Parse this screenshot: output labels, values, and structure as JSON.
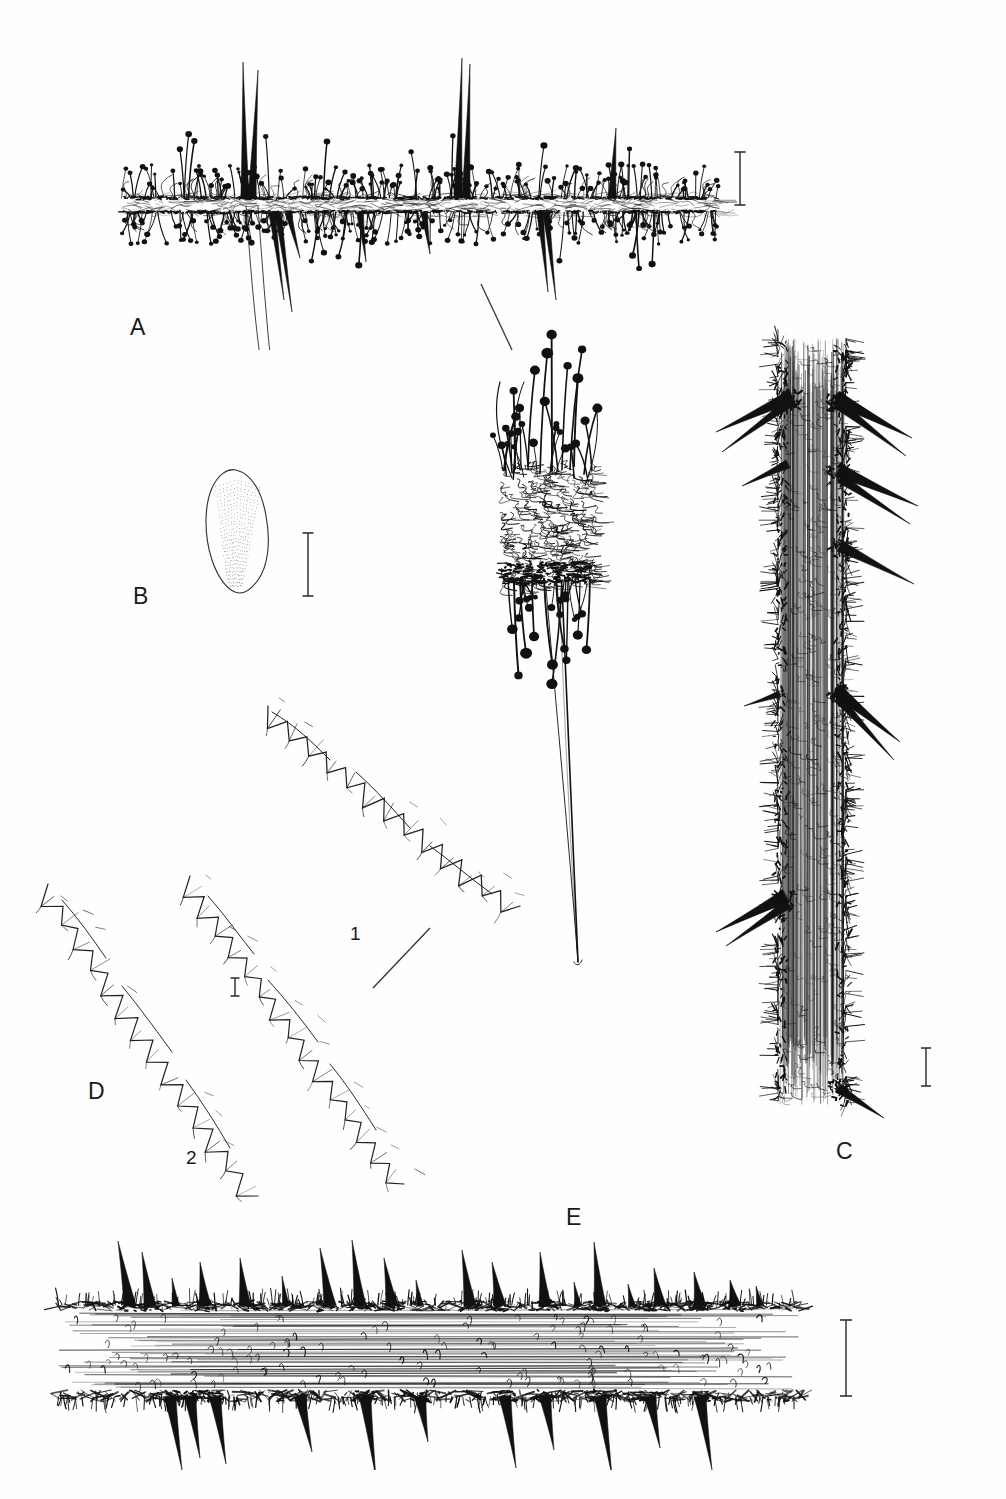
{
  "plate": {
    "title": "Botanical line-art plate of a spiny, glandular-hairy plant",
    "background_color": "#fefefe",
    "ink_color": "#111111",
    "width": 1006,
    "height": 1499,
    "medium": "pen-and-ink scientific illustration"
  },
  "panels": [
    {
      "id": "A",
      "label": "A",
      "label_x": 130,
      "label_y": 328,
      "subject": "stem or midrib in side view, densely covered with glandular capitate trichomes above and below, with several long slender prickles",
      "bounds": {
        "x": 118,
        "y": 60,
        "width": 610,
        "height": 280
      }
    },
    {
      "id": "B",
      "label": "B",
      "label_x": 133,
      "label_y": 597,
      "subject": "obovate petal or sepal with finely stippled longitudinal venation",
      "bounds": {
        "x": 196,
        "y": 468,
        "width": 80,
        "height": 125
      }
    },
    {
      "id": "C",
      "label": "C",
      "label_x": 836,
      "label_y": 1152,
      "subject": "vertical stem segment with dense indumentum and stout recurved lateral prickles",
      "bounds": {
        "x": 735,
        "y": 330,
        "width": 190,
        "height": 780
      }
    },
    {
      "id": "D",
      "label": "D",
      "label_x": 88,
      "label_y": 1092,
      "subject": "two leaf-margin details showing serrate to dentate teeth with bristle tips",
      "bounds": {
        "x": 45,
        "y": 700,
        "width": 480,
        "height": 480
      },
      "sub_labels": [
        {
          "text": "1",
          "x": 350,
          "y": 934
        },
        {
          "text": "2",
          "x": 186,
          "y": 1158
        }
      ]
    },
    {
      "id": "E",
      "label": "E",
      "label_x": 566,
      "label_y": 1218,
      "subject": "leaf midrib in side view bearing prickles on both surfaces among fine hairs",
      "bounds": {
        "x": 55,
        "y": 1255,
        "width": 770,
        "height": 200
      }
    },
    {
      "id": "flower",
      "label": "",
      "subject": "dense cluster of capitate glandular trichomes around a calyx, with a single very long tapering spine below",
      "bounds": {
        "x": 475,
        "y": 370,
        "width": 150,
        "height": 600
      }
    }
  ],
  "scale_bars": [
    {
      "for_panel": "A",
      "x": 740,
      "y_top": 152,
      "y_bottom": 205,
      "cap_width": 11,
      "orientation": "vertical"
    },
    {
      "for_panel": "B",
      "x": 308,
      "y_top": 533,
      "y_bottom": 596,
      "cap_width": 11,
      "orientation": "vertical"
    },
    {
      "for_panel": "D",
      "x": 235,
      "y_top": 978,
      "y_bottom": 996,
      "cap_width": 9,
      "orientation": "vertical"
    },
    {
      "for_panel": "C",
      "x": 926,
      "y_top": 1048,
      "y_bottom": 1086,
      "cap_width": 10,
      "orientation": "vertical"
    },
    {
      "for_panel": "E",
      "x": 846,
      "y_top": 1320,
      "y_bottom": 1396,
      "cap_width": 12,
      "orientation": "vertical"
    }
  ],
  "leader_lines": [
    {
      "from_panel": "A",
      "x1": 481,
      "y1": 284,
      "x2": 512,
      "y2": 350
    },
    {
      "from_panel": "D",
      "x1": 373,
      "y1": 988,
      "x2": 430,
      "y2": 928
    }
  ]
}
